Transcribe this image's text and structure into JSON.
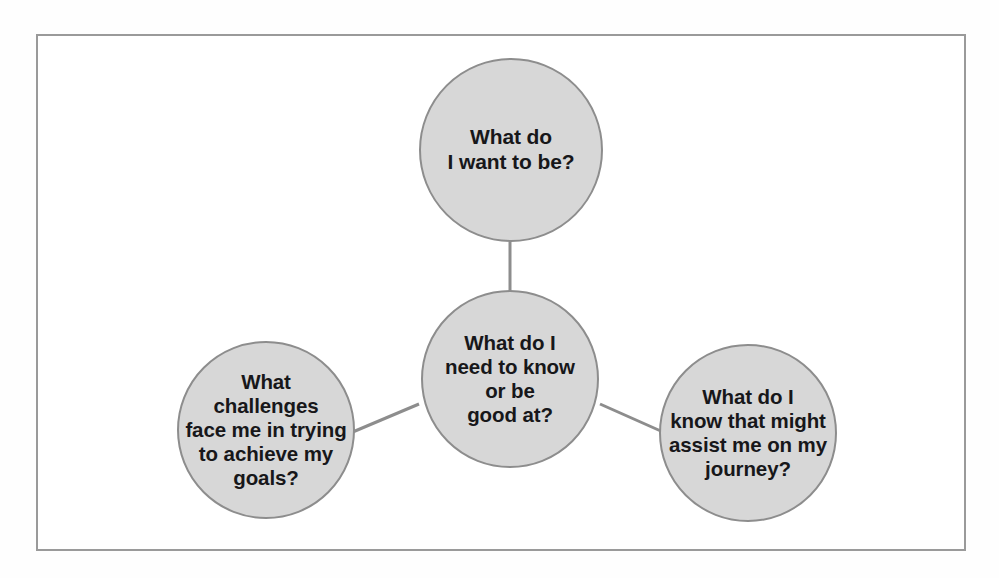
{
  "diagram": {
    "title": "What do I need to know or be good at?",
    "type": "hub-and-spoke mind map",
    "frame": {
      "border_color": "#9a9a9a",
      "background_color": "#ffffff"
    },
    "style": {
      "node_fill": "#d7d7d7",
      "node_stroke": "#8d8d8d",
      "text_color": "#17171a",
      "connector_color": "#8d8d8d"
    },
    "nodes": [
      {
        "id": "top",
        "name": "what-do-i-want-to-be",
        "text": "What do\nI want to be?",
        "role": "satellite",
        "position": "top"
      },
      {
        "id": "center",
        "name": "what-do-i-need-to-know",
        "text": "What do I\nneed to know\nor be\ngood at?",
        "role": "hub",
        "position": "center"
      },
      {
        "id": "left",
        "name": "what-challenges-face-me",
        "text": "What\nchallenges\nface me in trying\nto achieve my\ngoals?",
        "role": "satellite",
        "position": "bottom-left"
      },
      {
        "id": "right",
        "name": "what-do-i-know-that-might-assist",
        "text": "What do I\nknow that might\nassist me on my\njourney?",
        "role": "satellite",
        "position": "bottom-right"
      }
    ],
    "connectors": [
      {
        "from": "center",
        "to": "top",
        "name": "connector-center-top"
      },
      {
        "from": "center",
        "to": "left",
        "name": "connector-center-left"
      },
      {
        "from": "center",
        "to": "right",
        "name": "connector-center-right"
      }
    ]
  }
}
